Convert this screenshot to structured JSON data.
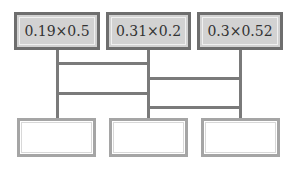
{
  "diagram": {
    "type": "ladder",
    "top_boxes": [
      {
        "label": "0.19×0.5"
      },
      {
        "label": "0.31×0.2"
      },
      {
        "label": "0.3×0.52"
      }
    ],
    "bottom_boxes": [
      {
        "label": ""
      },
      {
        "label": ""
      },
      {
        "label": ""
      }
    ],
    "rungs": [
      {
        "between": [
          1,
          2
        ],
        "order": 1
      },
      {
        "between": [
          2,
          3
        ],
        "order": 2
      },
      {
        "between": [
          1,
          2
        ],
        "order": 3
      },
      {
        "between": [
          2,
          3
        ],
        "order": 4
      }
    ],
    "colors": {
      "top_box_fill": "#d2d2d2",
      "top_box_border": "#6e6e6e",
      "bottom_box_border": "#a5a5a5",
      "line": "#7a7a7a"
    }
  }
}
